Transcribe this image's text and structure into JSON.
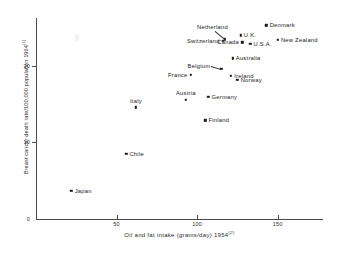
{
  "chart_data": {
    "type": "scatter",
    "title": "",
    "xlabel": "Oil and fat intake (grams/day) 1954",
    "xlabel_sup": "(2)",
    "ylabel": "Breast cancer death rate/100,000 population  1964",
    "ylabel_sup": "(1)",
    "xlim": [
      0,
      175
    ],
    "ylim": [
      0,
      26
    ],
    "xticks": [
      50,
      100,
      150
    ],
    "xtick_labels": [
      "50",
      "100",
      "150"
    ],
    "yticks": [
      0,
      10,
      20
    ],
    "ytick_labels": [
      "0",
      "10",
      "20"
    ],
    "grid": false,
    "legend": "none",
    "marker": "square",
    "marker_color": "#1a1a1a",
    "axis_color": "#4a4a4a",
    "points": [
      {
        "label": "Denmark",
        "x": 143.0,
        "y": 25.3,
        "label_pos": "right"
      },
      {
        "label": "U.K.",
        "x": 127.0,
        "y": 24.0,
        "label_pos": "right"
      },
      {
        "label": "New Zealand",
        "x": 150.0,
        "y": 23.4,
        "label_pos": "right"
      },
      {
        "label": "Netherland",
        "x": 117.0,
        "y": 23.5,
        "label_pos": "leader-above"
      },
      {
        "label": "Switzerland",
        "x": 116.0,
        "y": 23.3,
        "label_pos": "left"
      },
      {
        "label": "Canada",
        "x": 128.0,
        "y": 23.1,
        "label_pos": "left"
      },
      {
        "label": "U.S.A.",
        "x": 133.0,
        "y": 22.9,
        "label_pos": "right"
      },
      {
        "label": "Australia",
        "x": 122.0,
        "y": 21.0,
        "label_pos": "right"
      },
      {
        "label": "Belgium",
        "x": 115.0,
        "y": 19.6,
        "label_pos": "leader-left"
      },
      {
        "label": "Ireland",
        "x": 121.0,
        "y": 18.7,
        "label_pos": "right"
      },
      {
        "label": "France",
        "x": 96.0,
        "y": 18.8,
        "label_pos": "left"
      },
      {
        "label": "Norway",
        "x": 125.0,
        "y": 18.2,
        "label_pos": "right"
      },
      {
        "label": "Germany",
        "x": 107.0,
        "y": 16.0,
        "label_pos": "right"
      },
      {
        "label": "Austria",
        "x": 93.0,
        "y": 15.6,
        "label_pos": "above"
      },
      {
        "label": "Italy",
        "x": 62.0,
        "y": 14.6,
        "label_pos": "above"
      },
      {
        "label": "Finland",
        "x": 105.0,
        "y": 12.9,
        "label_pos": "right"
      },
      {
        "label": "Chile",
        "x": 56.0,
        "y": 8.5,
        "label_pos": "right"
      },
      {
        "label": "Japan",
        "x": 22.0,
        "y": 3.7,
        "label_pos": "right"
      }
    ]
  }
}
